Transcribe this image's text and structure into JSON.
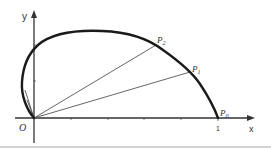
{
  "diagram": {
    "axes": {
      "x_label": "x",
      "y_label": "y",
      "origin_label": "O",
      "x_tick_label": "1"
    },
    "points": [
      {
        "name": "P0",
        "base": "P",
        "sub": "0"
      },
      {
        "name": "P1",
        "base": "P",
        "sub": "1"
      },
      {
        "name": "P2",
        "base": "P",
        "sub": "2"
      }
    ],
    "colors": {
      "curve": "#1a1a1a",
      "axis": "#333333",
      "ray": "#555555",
      "divider": "#d4d4d4"
    }
  }
}
